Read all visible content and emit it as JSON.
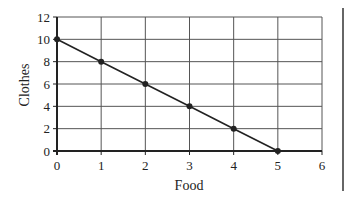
{
  "chart_data": {
    "type": "line",
    "title": "",
    "xlabel": "Food",
    "ylabel": "Clothes",
    "xlim": [
      0,
      6
    ],
    "ylim": [
      0,
      12
    ],
    "xticks": [
      0,
      1,
      2,
      3,
      4,
      5,
      6
    ],
    "yticks": [
      0,
      2,
      4,
      6,
      8,
      10,
      12
    ],
    "grid": true,
    "legend": null,
    "series": [
      {
        "name": "Production possibilities",
        "x": [
          0,
          1,
          2,
          3,
          4,
          5
        ],
        "y": [
          10,
          8,
          6,
          4,
          2,
          0
        ],
        "color": "#222222",
        "markers": true
      }
    ]
  }
}
